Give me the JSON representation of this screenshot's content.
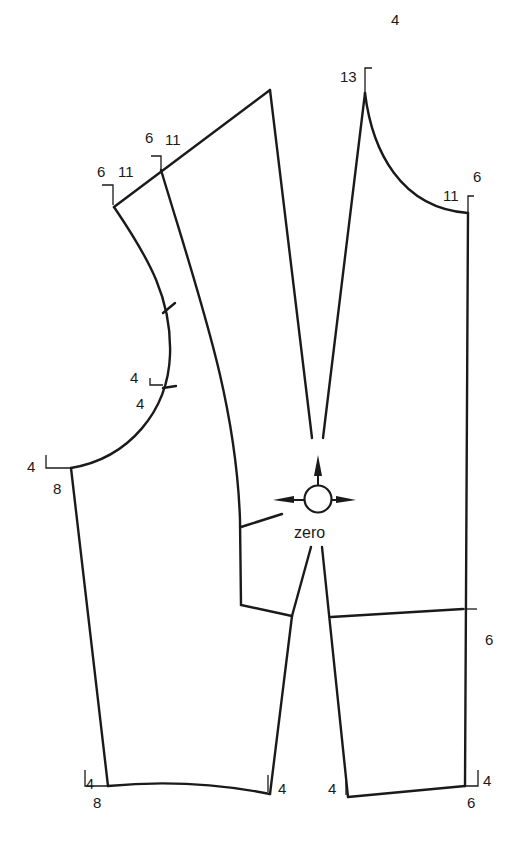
{
  "diagram": {
    "type": "sewing-pattern-bodice-front-back",
    "center_label": "zero",
    "line_color": "#1a1a1a",
    "background": "#ffffff",
    "labels": {
      "left_shoulder_a": "6",
      "left_shoulder_b": "11",
      "mid_shoulder_a": "6",
      "mid_shoulder_b": "11",
      "back_neck_top": "4",
      "back_neck_side": "13",
      "right_shoulder_a": "6",
      "right_shoulder_b": "11",
      "armhole_notch_a": "4",
      "armhole_notch_b": "4",
      "underarm_a": "4",
      "underarm_b": "8",
      "waist_right": "6",
      "hem_left_a": "4",
      "hem_left_b": "8",
      "hem_mid_left": "4",
      "hem_mid_right": "4",
      "hem_right_a": "4",
      "hem_right_b": "6"
    }
  }
}
